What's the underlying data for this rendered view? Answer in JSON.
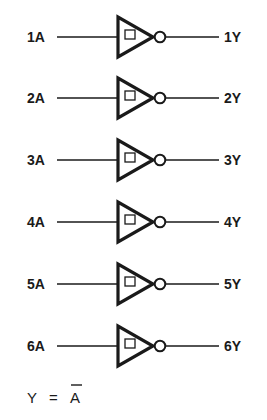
{
  "diagram": {
    "type": "logic-diagram",
    "gate_type": "schmitt-trigger-inverter",
    "gates": [
      {
        "input": "1A",
        "output": "1Y",
        "y": 37
      },
      {
        "input": "2A",
        "output": "2Y",
        "y": 98
      },
      {
        "input": "3A",
        "output": "3Y",
        "y": 160
      },
      {
        "input": "4A",
        "output": "4Y",
        "y": 222
      },
      {
        "input": "5A",
        "output": "5Y",
        "y": 284
      },
      {
        "input": "6A",
        "output": "6Y",
        "y": 346
      }
    ],
    "equation": {
      "lhs": "Y",
      "op": "=",
      "rhs": "A",
      "rhs_negated": true
    },
    "colors": {
      "ink": "#1a1a1a",
      "background": "#ffffff"
    }
  }
}
